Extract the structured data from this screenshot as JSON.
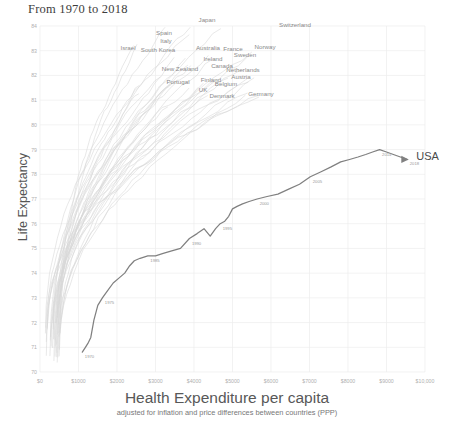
{
  "chart_data": {
    "type": "line",
    "title": "From 1970 to 2018",
    "xlabel": "Health Expenditure per capita",
    "xsublabel": "adjusted for inflation and price differences between countries (PPP)",
    "ylabel": "Life Expectancy",
    "xlim": [
      0,
      10000
    ],
    "ylim": [
      70,
      84
    ],
    "grid": true,
    "legend_position": "inline-labels",
    "highlight_color": "#808080",
    "background_series_color": "#d8d8d8",
    "xticks": [
      "$0",
      "$1000",
      "$2000",
      "$3000",
      "$4000",
      "$5000",
      "$6000",
      "$7000",
      "$8000",
      "$9000",
      "$10,000"
    ],
    "xtick_values": [
      0,
      1000,
      2000,
      3000,
      4000,
      5000,
      6000,
      7000,
      8000,
      9000,
      10000
    ],
    "yticks": [
      "70",
      "71",
      "72",
      "73",
      "74",
      "75",
      "76",
      "77",
      "78",
      "79",
      "80",
      "81",
      "82",
      "83",
      "84"
    ],
    "ytick_values": [
      70,
      71,
      72,
      73,
      74,
      75,
      76,
      77,
      78,
      79,
      80,
      81,
      82,
      83,
      84
    ],
    "highlight_series": {
      "name": "USA",
      "end_label": "USA",
      "x": [
        1100,
        1180,
        1260,
        1320,
        1400,
        1500,
        1620,
        1760,
        1900,
        2050,
        2200,
        2330,
        2450,
        2600,
        2800,
        3000,
        3200,
        3420,
        3650,
        3880,
        4080,
        4260,
        4420,
        4560,
        4680,
        4800,
        4900,
        5000,
        5120,
        5260,
        5430,
        5640,
        5900,
        6180,
        6460,
        6740,
        7020,
        7300,
        7560,
        7810,
        8040,
        8260,
        8460,
        8640,
        8820,
        9000,
        9180,
        9360,
        9540
      ],
      "y": [
        70.8,
        71.0,
        71.2,
        71.4,
        72.1,
        72.7,
        73.0,
        73.3,
        73.6,
        73.8,
        74.0,
        74.3,
        74.5,
        74.6,
        74.7,
        74.7,
        74.8,
        74.9,
        75.0,
        75.4,
        75.6,
        75.8,
        75.5,
        75.8,
        76.0,
        76.1,
        76.3,
        76.6,
        76.7,
        76.8,
        76.9,
        77.0,
        77.1,
        77.2,
        77.4,
        77.6,
        77.9,
        78.1,
        78.3,
        78.5,
        78.6,
        78.7,
        78.8,
        78.9,
        79.0,
        78.9,
        78.8,
        78.7,
        78.6
      ],
      "year_annotations": [
        {
          "year": "1970",
          "x": 1100,
          "y": 70.8
        },
        {
          "year": "1975",
          "x": 1620,
          "y": 73.0
        },
        {
          "year": "1985",
          "x": 2800,
          "y": 74.7
        },
        {
          "year": "1990",
          "x": 3880,
          "y": 75.4
        },
        {
          "year": "1995",
          "x": 4680,
          "y": 76.0
        },
        {
          "year": "2000",
          "x": 5640,
          "y": 77.0
        },
        {
          "year": "2005",
          "x": 7020,
          "y": 77.9
        },
        {
          "year": "2014",
          "x": 8820,
          "y": 79.0
        },
        {
          "year": "2018",
          "x": 9540,
          "y": 78.6
        }
      ]
    },
    "country_labels": [
      {
        "name": "Japan",
        "px": 207,
        "py": 22
      },
      {
        "name": "Switzerland",
        "px": 295,
        "py": 27
      },
      {
        "name": "Spain",
        "px": 164,
        "py": 35
      },
      {
        "name": "Italy",
        "px": 166,
        "py": 43
      },
      {
        "name": "Israel",
        "px": 128,
        "py": 50
      },
      {
        "name": "South Korea",
        "px": 158,
        "py": 52
      },
      {
        "name": "Australia",
        "px": 208,
        "py": 50
      },
      {
        "name": "France",
        "px": 233,
        "py": 51
      },
      {
        "name": "Norway",
        "px": 265,
        "py": 49
      },
      {
        "name": "Sweden",
        "px": 245,
        "py": 57
      },
      {
        "name": "Ireland",
        "px": 213,
        "py": 61
      },
      {
        "name": "New Zealand",
        "px": 180,
        "py": 71
      },
      {
        "name": "Canada",
        "px": 222,
        "py": 68
      },
      {
        "name": "Netherlands",
        "px": 243,
        "py": 72
      },
      {
        "name": "Austria",
        "px": 241,
        "py": 79
      },
      {
        "name": "Portugal",
        "px": 178,
        "py": 84
      },
      {
        "name": "Finland",
        "px": 211,
        "py": 82
      },
      {
        "name": "Belgium",
        "px": 226,
        "py": 86
      },
      {
        "name": "UK",
        "px": 203,
        "py": 92
      },
      {
        "name": "Denmark",
        "px": 222,
        "py": 98
      },
      {
        "name": "Germany",
        "px": 261,
        "py": 96
      }
    ]
  }
}
